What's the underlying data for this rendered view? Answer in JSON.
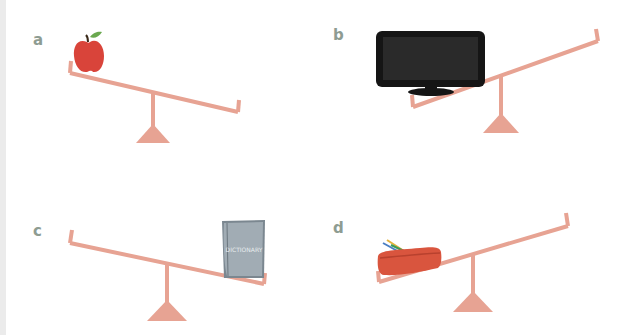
{
  "colors": {
    "seesaw": "#e7a393",
    "label": "#8e9c92",
    "apple": "#d9443a",
    "apple_leaf": "#6aa84f",
    "apple_stem": "#3b2a1a",
    "tv_frame": "#151515",
    "tv_screen": "#2a2a2a",
    "book": "#8f9aa3",
    "pencil_case": "#d9553e",
    "edge_strip": "#ebebeb"
  },
  "panels": [
    {
      "id": "a",
      "label": "a",
      "object": "apple",
      "heavier_side": "left",
      "description": "Seesaw tilted down to the right; apple on raised left end"
    },
    {
      "id": "b",
      "label": "b",
      "object": "television",
      "heavier_side": "left",
      "description": "Seesaw tilted down to the left; TV on lowered left end"
    },
    {
      "id": "c",
      "label": "c",
      "object": "book",
      "heavier_side": "right",
      "description": "Seesaw tilted down to the right; book on lowered right end"
    },
    {
      "id": "d",
      "label": "d",
      "object": "pencil case",
      "heavier_side": "left",
      "description": "Seesaw tilted down to the left; pencil case on lowered left end"
    }
  ],
  "book_cover_text": "DICTIONARY"
}
